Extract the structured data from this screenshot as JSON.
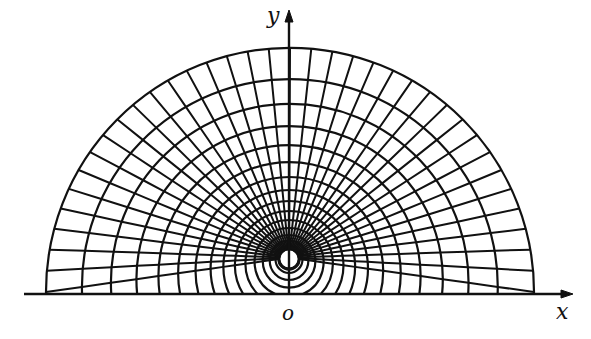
{
  "figure": {
    "type": "orthogonal curvilinear grid (circles around a hole above a wall)",
    "colors": {
      "ink": "#111111",
      "background": "#ffffff"
    },
    "axes": {
      "x_label": "x",
      "y_label": "y",
      "origin_label": "o",
      "origin_px": [
        290,
        294
      ],
      "x_axis": {
        "from": [
          24,
          294
        ],
        "to": [
          573,
          294
        ]
      },
      "y_axis": {
        "from": [
          289,
          294
        ],
        "to": [
          289,
          10
        ]
      }
    },
    "hole": {
      "center_px": [
        289,
        259
      ],
      "radius_px": 10
    },
    "outer_boundary": {
      "center_px": [
        290,
        292
      ],
      "radius_px": 244
    },
    "circle_tops_px": [
      47,
      79,
      104,
      126,
      145,
      162,
      177,
      190,
      201,
      211,
      220,
      228,
      235,
      241,
      246,
      250
    ],
    "spoke_step_deg": 5,
    "spoke_count": 37
  }
}
